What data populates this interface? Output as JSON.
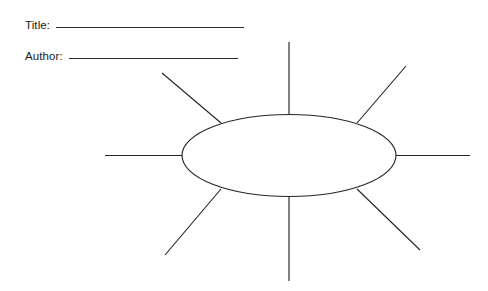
{
  "page": {
    "background_color": "#ffffff",
    "ink_color": "#262626",
    "width": 488,
    "height": 291,
    "document_type": "blank graphic organizer worksheet"
  },
  "header": {
    "fields": [
      {
        "label": "Title:",
        "value": "",
        "rule_width": 188
      },
      {
        "label": "Author:",
        "value": "",
        "rule_width": 169
      }
    ]
  },
  "diagram": {
    "type": "web-cluster-organizer",
    "center_bubble": {
      "shape": "ellipse",
      "cx": 289,
      "cy": 155.5,
      "rx": 107,
      "ry": 41,
      "fill": "#ffffff",
      "stroke": "#262626",
      "text": ""
    },
    "spoke_count": 8,
    "spokes": [
      {
        "name": "spoke-top",
        "x1": 289,
        "y1": 114,
        "x2": 289,
        "y2": 42,
        "text": ""
      },
      {
        "name": "spoke-top-right",
        "x1": 357,
        "y1": 123,
        "x2": 406,
        "y2": 66,
        "text": ""
      },
      {
        "name": "spoke-right",
        "x1": 396,
        "y1": 155.5,
        "x2": 470,
        "y2": 155.5,
        "text": ""
      },
      {
        "name": "spoke-bottom-right",
        "x1": 357,
        "y1": 189,
        "x2": 420,
        "y2": 250,
        "text": ""
      },
      {
        "name": "spoke-bottom",
        "x1": 289,
        "y1": 196,
        "x2": 289,
        "y2": 281,
        "text": ""
      },
      {
        "name": "spoke-bottom-left",
        "x1": 221,
        "y1": 189,
        "x2": 165,
        "y2": 255,
        "text": ""
      },
      {
        "name": "spoke-left",
        "x1": 182,
        "y1": 155.5,
        "x2": 105,
        "y2": 155.5,
        "text": ""
      },
      {
        "name": "spoke-top-left",
        "x1": 221,
        "y1": 123,
        "x2": 162,
        "y2": 73,
        "text": ""
      }
    ]
  }
}
